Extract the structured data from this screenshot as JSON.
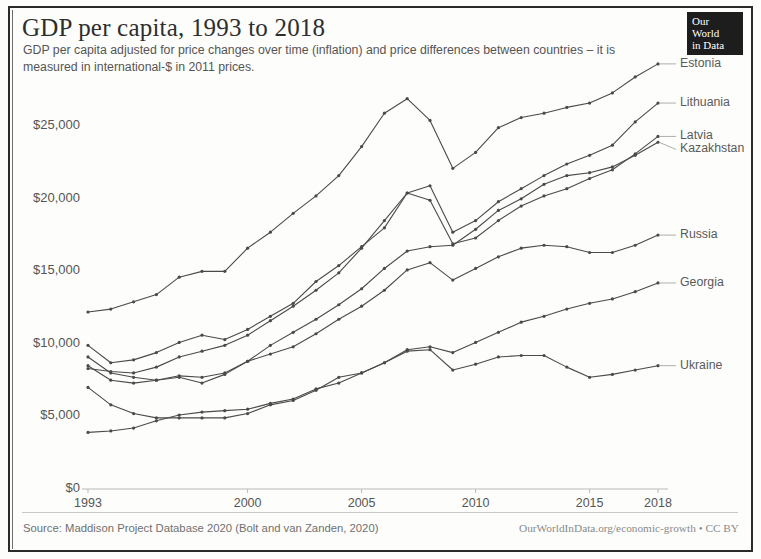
{
  "header": {
    "title": "GDP per capita, 1993 to 2018",
    "subtitle": "GDP per capita adjusted for price changes over time (inflation) and price differences between countries – it is measured in international-$ in 2011 prices.",
    "logo_line1": "Our World",
    "logo_line2": "in Data"
  },
  "footer": {
    "source": "Source: Maddison Project Database 2020 (Bolt and van Zanden, 2020)",
    "attribution": "OurWorldInData.org/economic-growth • CC BY"
  },
  "colors": {
    "line": "#4a4a4a",
    "axis": "#b9b9b9",
    "text": "#555555",
    "logo_bg": "#1d1d1d"
  },
  "chart_data": {
    "type": "line",
    "title": "GDP per capita, 1993 to 2018",
    "subtitle": "GDP per capita adjusted for price changes over time (inflation) and price differences between countries – it is measured in international-$ in 2011 prices.",
    "xlabel": "",
    "ylabel": "",
    "xlim": [
      1993,
      2018
    ],
    "ylim": [
      0,
      27500
    ],
    "grid": false,
    "legend_position": "right-inline",
    "x_ticks": [
      1993,
      2000,
      2005,
      2010,
      2015,
      2018
    ],
    "x_tick_labels": [
      "1993",
      "2000",
      "2005",
      "2010",
      "2015",
      "2018"
    ],
    "y_ticks": [
      0,
      5000,
      10000,
      15000,
      20000,
      25000
    ],
    "y_tick_labels": [
      "$0",
      "$5,000",
      "$10,000",
      "$15,000",
      "$20,000",
      "$25,000"
    ],
    "x": [
      1993,
      1994,
      1995,
      1996,
      1997,
      1998,
      1999,
      2000,
      2001,
      2002,
      2003,
      2004,
      2005,
      2006,
      2007,
      2008,
      2009,
      2010,
      2011,
      2012,
      2013,
      2014,
      2015,
      2016,
      2017,
      2018
    ],
    "series": [
      {
        "name": "Estonia",
        "values": [
          12200,
          12400,
          12900,
          13400,
          14600,
          15000,
          15000,
          16600,
          17700,
          19000,
          20200,
          21600,
          23600,
          25900,
          26900,
          25400,
          22100,
          23200,
          24900,
          25600,
          25900,
          26300,
          26600,
          27300,
          28400,
          29300
        ]
      },
      {
        "name": "Lithuania",
        "values": [
          9900,
          8700,
          8900,
          9400,
          10100,
          10600,
          10300,
          11000,
          11900,
          12800,
          14300,
          15400,
          16700,
          18000,
          20400,
          20900,
          17700,
          18500,
          19800,
          20700,
          21600,
          22400,
          23000,
          23700,
          25300,
          26600
        ]
      },
      {
        "name": "Kazakhstan",
        "values": [
          8500,
          7500,
          7300,
          7500,
          7800,
          7700,
          8000,
          8800,
          9900,
          10800,
          11700,
          12700,
          13800,
          15200,
          16400,
          16700,
          16800,
          17900,
          19200,
          20000,
          21000,
          21600,
          21800,
          22200,
          23000,
          23900
        ]
      },
      {
        "name": "Russia",
        "values": [
          9100,
          8000,
          7700,
          7500,
          7700,
          7300,
          7900,
          8800,
          9300,
          9800,
          10700,
          11700,
          12600,
          13700,
          15100,
          15600,
          14400,
          15200,
          16000,
          16600,
          16800,
          16700,
          16300,
          16300,
          16800,
          17500
        ]
      },
      {
        "name": "Latvia",
        "values": [
          8300,
          8100,
          8000,
          8400,
          9100,
          9500,
          9900,
          10600,
          11600,
          12600,
          13700,
          14900,
          16600,
          18500,
          20400,
          19900,
          16900,
          17300,
          18500,
          19500,
          20200,
          20700,
          21400,
          22000,
          23100,
          24300
        ]
      },
      {
        "name": "Georgia",
        "values": [
          3900,
          4000,
          4200,
          4700,
          5100,
          5300,
          5400,
          5500,
          5900,
          6200,
          6900,
          7300,
          8000,
          8700,
          9600,
          9800,
          9400,
          10100,
          10800,
          11500,
          11900,
          12400,
          12800,
          13100,
          13600,
          14200
        ]
      },
      {
        "name": "Ukraine",
        "values": [
          7000,
          5800,
          5200,
          4900,
          4900,
          4900,
          4900,
          5200,
          5800,
          6100,
          6800,
          7700,
          8000,
          8700,
          9500,
          9600,
          8200,
          8600,
          9100,
          9200,
          9200,
          8400,
          7700,
          7900,
          8200,
          8500
        ]
      }
    ],
    "series_end_labels": [
      {
        "name": "Estonia",
        "label": "Estonia"
      },
      {
        "name": "Lithuania",
        "label": "Lithuania"
      },
      {
        "name": "Kazakhstan",
        "label": "Kazakhstan"
      },
      {
        "name": "Russia",
        "label": "Russia"
      },
      {
        "name": "Latvia",
        "label": "Latvia"
      },
      {
        "name": "Georgia",
        "label": "Georgia"
      },
      {
        "name": "Ukraine",
        "label": "Ukraine"
      }
    ]
  }
}
